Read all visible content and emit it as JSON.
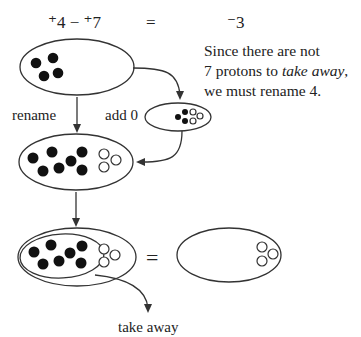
{
  "equation": {
    "left": "⁺4 − ⁺7",
    "equals": "=",
    "result": "⁻3"
  },
  "explanation": {
    "line1": "Since there are not",
    "line2_prefix": "7 protons to ",
    "line2_emphasis": "take away",
    "line2_suffix": ",",
    "line3": "we must rename 4."
  },
  "labels": {
    "rename": "rename",
    "add_zero": "add 0",
    "equals": "=",
    "take_away": "take away"
  },
  "sets": {
    "initial": {
      "protons": 4,
      "electrons": 0
    },
    "zero_pairs": {
      "protons": 3,
      "electrons": 3
    },
    "renamed": {
      "protons": 7,
      "electrons": 3
    },
    "result": {
      "protons": 0,
      "electrons": 3
    }
  },
  "colors": {
    "proton": "#111111",
    "electron_fill": "#ffffff",
    "stroke": "#333333"
  }
}
